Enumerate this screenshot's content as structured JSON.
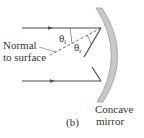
{
  "figure": {
    "panel_label": "(b)",
    "mirror_label_line1": "Concave",
    "mirror_label_line2": "mirror",
    "normal_label_line1": "Normal",
    "normal_label_line2": "to surface",
    "theta_incident": {
      "symbol": "θ",
      "subscript": "i"
    },
    "theta_reflected": {
      "symbol": "θ",
      "subscript": "r"
    }
  },
  "colors": {
    "ray": "#4a4a4a",
    "mirror_fill": "#c8c8c8",
    "mirror_stroke": "#8a8a8a",
    "text": "#333333",
    "background": "#ffffff"
  }
}
